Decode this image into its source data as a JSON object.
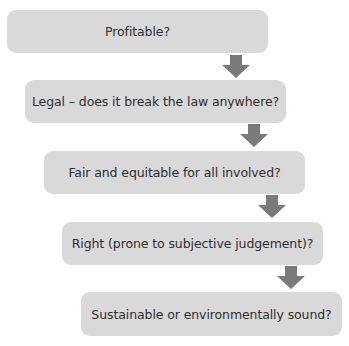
{
  "diagram": {
    "type": "flowchart-cascade",
    "colors": {
      "box_fill": "#d9d9d9",
      "arrow": "#7a7a7a",
      "text": "#2e2e2e"
    },
    "steps": [
      {
        "label": "Profitable?"
      },
      {
        "label": "Legal – does it break the law anywhere?"
      },
      {
        "label": "Fair and equitable for all involved?"
      },
      {
        "label": "Right (prone to subjective judgement)?"
      },
      {
        "label": "Sustainable or environmentally sound?"
      }
    ],
    "connectors": [
      {
        "from": 0,
        "to": 1,
        "icon": "down-arrow-icon"
      },
      {
        "from": 1,
        "to": 2,
        "icon": "down-arrow-icon"
      },
      {
        "from": 2,
        "to": 3,
        "icon": "down-arrow-icon"
      },
      {
        "from": 3,
        "to": 4,
        "icon": "down-arrow-icon"
      }
    ]
  }
}
